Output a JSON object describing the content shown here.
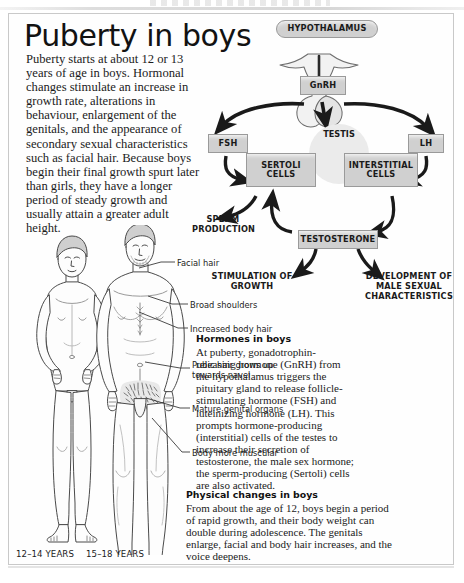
{
  "page": {
    "title": "Puberty in boys",
    "intro": "Puberty starts at about 12 or 13 years of age in boys. Hormonal changes stimulate an increase in growth rate, alterations in behaviour, enlargement of the genitals, and the appearance of secondary sexual characteristics such as facial hair. Because boys begin their final growth spurt later than girls, they have a longer period of steady growth and usually attain a greater adult height."
  },
  "diagram": {
    "hypothalamus": "HYPOTHALAMUS",
    "gnrh": "GnRH",
    "fsh": "FSH",
    "lh": "LH",
    "testis": "TESTIS",
    "sertoli": "SERTOLI CELLS",
    "interstitial": "INTERSTITIAL CELLS",
    "testosterone": "TESTOSTERONE",
    "sperm_production": "SPERM PRODUCTION",
    "stimulation_of_growth": "STIMULATION OF GROWTH",
    "development": "DEVELOPMENT OF MALE SEXUAL CHARACTERISTICS"
  },
  "figure_labels": {
    "facial_hair": "Facial hair",
    "broad_shoulders": "Broad shoulders",
    "increased_body_hair": "Increased body hair",
    "pubic_hair": "Pubic hair grows up towards navel",
    "mature_genitals": "Mature genital organs",
    "body_muscular": "Body more muscular",
    "age_young": "12–14 YEARS",
    "age_old": "15–18 YEARS"
  },
  "hormones_section": {
    "heading": "Hormones in boys",
    "body": "At puberty, gonadotrophin-releasing hormone (GnRH) from the hypothalamus triggers the pituitary gland to release follicle-stimulating hormone (FSH) and luteinizing hormone (LH). This prompts hormone-producing (interstitial) cells of the testes to increase their secretion of testosterone, the male sex hormone; the sperm-producing (Sertoli) cells are also activated."
  },
  "physical_section": {
    "heading": "Physical changes in boys",
    "body": "From about the age of 12, boys begin a period of rapid growth, and their body weight can double during adolescence. The genitals enlarge, facial and body hair increases, and the voice deepens."
  },
  "colors": {
    "box_fill": "#d0d0d0",
    "box_stroke": "#9a9a9a",
    "testis_circle": "#ebebeb",
    "text": "#1a1a1a",
    "page_bg": "#ffffff"
  }
}
